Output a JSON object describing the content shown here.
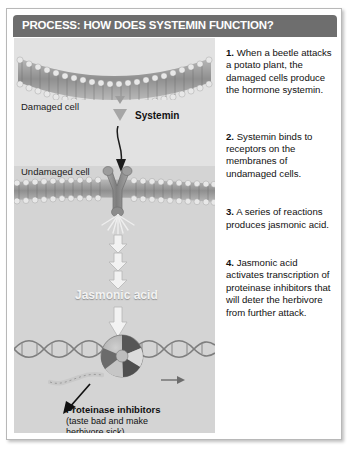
{
  "header": {
    "title": "PROCESS: HOW DOES SYSTEMIN FUNCTION?"
  },
  "diagram": {
    "damaged_cell_label": "Damaged cell",
    "systemin_label": "Systemin",
    "undamaged_cell_label": "Undamaged cell",
    "jasmonic_acid_label": "Jasmonic acid",
    "proteinase_title": "Proteinase inhibitors",
    "proteinase_sub_line1": "(taste bad and make",
    "proteinase_sub_line2": "herbivore sick)",
    "icons": {
      "systemin_triangle": "triangle-down-icon",
      "systemin_arrow": "curved-arrow-down-icon",
      "receptor": "y-receptor-icon",
      "signal_burst": "radiating-burst-icon",
      "cascade_arrows": "triple-arrow-down-icon",
      "transcription_arrow": "arrow-down-icon",
      "dna": "dna-helix-icon",
      "polymerase": "rna-polymerase-icon",
      "mrna_arrow": "arrow-right-icon",
      "pointer_arrow": "arrow-pointer-icon"
    }
  },
  "steps": [
    {
      "number": "1.",
      "text": "When a beetle attacks a potato plant, the damaged cells produce the hormone systemin."
    },
    {
      "number": "2.",
      "text": "Systemin binds to receptors on the membranes of undamaged cells."
    },
    {
      "number": "3.",
      "text": "A series of reactions produces jasmonic acid."
    },
    {
      "number": "4.",
      "text": "Jasmonic acid activates transcription of proteinase inhibitors that will deter the herbivore from further attack."
    }
  ],
  "colors": {
    "header_bar": "#6e6e6e",
    "panel_top": "#e2e2e2",
    "panel_bottom": "#d4d4d4",
    "border": "#b8b8b8",
    "text": "#111111"
  }
}
